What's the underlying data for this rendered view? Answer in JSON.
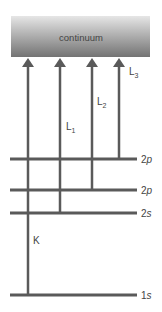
{
  "diagram": {
    "continuum_label": "continuum",
    "colors": {
      "continuum_top": "#e2e2e2",
      "continuum_bottom": "#777777",
      "line": "#5a5a5a",
      "text": "#444444"
    },
    "levels": [
      {
        "id": "2p3",
        "label_main": "2",
        "label_sub": "p",
        "y": 159
      },
      {
        "id": "2p1",
        "label_main": "2",
        "label_sub": "p",
        "y": 190
      },
      {
        "id": "2s",
        "label_main": "2",
        "label_sub": "s",
        "y": 213
      },
      {
        "id": "1s",
        "label_main": "1",
        "label_sub": "s",
        "y": 295
      }
    ],
    "transitions": [
      {
        "id": "K",
        "label": "K",
        "subscript": "",
        "x": 28,
        "from_level": "1s"
      },
      {
        "id": "L1",
        "label": "L",
        "subscript": "1",
        "x": 60,
        "from_level": "2s"
      },
      {
        "id": "L2",
        "label": "L",
        "subscript": "2",
        "x": 92,
        "from_level": "2p1"
      },
      {
        "id": "L3",
        "label": "L",
        "subscript": "3",
        "x": 119,
        "from_level": "2p3"
      }
    ]
  }
}
